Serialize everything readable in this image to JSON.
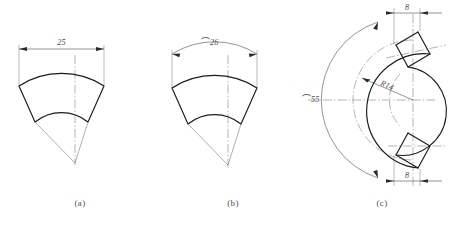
{
  "sheet": {
    "background": "#ffffff",
    "line_color": "#1b1b1b",
    "thin_line_color": "#5e5e5e",
    "text_color": "#4a4a4a"
  },
  "figures": [
    {
      "id": "a",
      "caption": "(a)",
      "kind": "annular-sector",
      "dimension": {
        "name": "chord-width",
        "value": "25",
        "symbol": "",
        "label": "25",
        "line_style": "straight",
        "position": "top"
      }
    },
    {
      "id": "b",
      "caption": "(b)",
      "kind": "annular-sector",
      "dimension": {
        "name": "arc-length",
        "value": "26",
        "symbol": "⌒",
        "label": "⌒26",
        "line_style": "arc",
        "position": "top"
      }
    },
    {
      "id": "c",
      "caption": "(c)",
      "kind": "c-bracket",
      "dimensions": [
        {
          "name": "top-width",
          "value": "8",
          "symbol": "",
          "label": "8",
          "line_style": "straight",
          "position": "top"
        },
        {
          "name": "inner-radius",
          "value": "14",
          "symbol": "R",
          "label": "R14",
          "line_style": "leader",
          "position": "center"
        },
        {
          "name": "outer-arc-length",
          "value": "55",
          "symbol": "⌒",
          "label": "⌒55",
          "line_style": "arc",
          "position": "left"
        },
        {
          "name": "bottom-width",
          "value": "8",
          "symbol": "",
          "label": "8",
          "line_style": "straight",
          "position": "bottom"
        }
      ]
    }
  ]
}
